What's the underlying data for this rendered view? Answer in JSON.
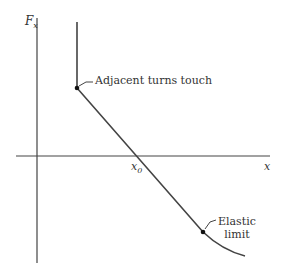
{
  "diagram": {
    "axes": {
      "y_label": "F",
      "y_label_sub": "x",
      "x_label": "x"
    },
    "points": {
      "x0_label": "x",
      "x0_sub": "0"
    },
    "annotations": {
      "touch": "Adjacent turns touch",
      "elastic_line1": "Elastic",
      "elastic_line2": "limit"
    },
    "colors": {
      "line": "#444444",
      "text": "#333333"
    }
  }
}
